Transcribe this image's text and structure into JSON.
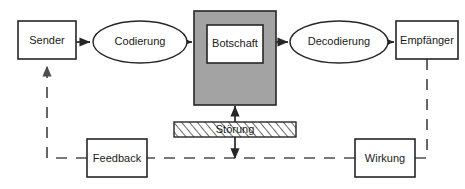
{
  "diagram": {
    "canvas": {
      "width": 465,
      "height": 189,
      "background": "#ffffff"
    },
    "colors": {
      "stroke": "#262626",
      "dashed_stroke": "#4d4d4d",
      "node_fill": "#ffffff",
      "message_outer_fill": "#a3a3a3",
      "noise_hatch_fill": "#ffffff",
      "text": "#1a1a1a"
    },
    "nodes": [
      {
        "id": "sender",
        "label": "Sender",
        "shape": "rectangle",
        "x": 18,
        "y": 21,
        "width": 58,
        "height": 38
      },
      {
        "id": "codierung",
        "label": "Codierung",
        "shape": "ellipse",
        "cx": 140,
        "cy": 42,
        "rx": 47,
        "ry": 21
      },
      {
        "id": "botschaft",
        "label": "Botschaft",
        "shape": "nested-rectangle",
        "x": 194,
        "y": 11,
        "width": 82,
        "height": 94,
        "inner_x": 207,
        "inner_y": 25,
        "inner_width": 56,
        "inner_height": 38
      },
      {
        "id": "decodierung",
        "label": "Decodierung",
        "shape": "ellipse",
        "cx": 339,
        "cy": 42,
        "rx": 49,
        "ry": 21
      },
      {
        "id": "empfaenger",
        "label": "Empfänger",
        "shape": "rectangle",
        "x": 396,
        "y": 21,
        "width": 62,
        "height": 38
      },
      {
        "id": "stoerung",
        "label": "Störung",
        "shape": "hatched-bar",
        "x": 174,
        "y": 122,
        "width": 122,
        "height": 15
      },
      {
        "id": "feedback",
        "label": "Feedback",
        "shape": "rectangle",
        "x": 87,
        "y": 139,
        "width": 60,
        "height": 38
      },
      {
        "id": "wirkung",
        "label": "Wirkung",
        "shape": "rectangle",
        "x": 355,
        "y": 139,
        "width": 60,
        "height": 38
      }
    ],
    "connections": [
      {
        "id": "sender-to-codierung",
        "from": "sender",
        "to": "codierung",
        "style": "solid",
        "arrow": "single"
      },
      {
        "id": "codierung-to-botschaft",
        "from": "codierung",
        "to": "botschaft",
        "style": "solid",
        "arrow": "single"
      },
      {
        "id": "botschaft-to-decodierung",
        "from": "botschaft",
        "to": "decodierung",
        "style": "solid",
        "arrow": "single"
      },
      {
        "id": "decodierung-to-empfaenger",
        "from": "decodierung",
        "to": "empfaenger",
        "style": "solid",
        "arrow": "single"
      },
      {
        "id": "stoerung-to-botschaft",
        "from": "stoerung",
        "to": "botschaft",
        "style": "solid",
        "arrow": "double"
      },
      {
        "id": "empfaenger-to-wirkung",
        "from": "empfaenger",
        "to": "wirkung",
        "style": "dashed",
        "arrow": "none"
      },
      {
        "id": "wirkung-to-feedback",
        "from": "wirkung",
        "to": "feedback",
        "style": "dashed",
        "arrow": "none"
      },
      {
        "id": "feedback-to-sender",
        "from": "feedback",
        "to": "sender",
        "style": "dashed",
        "arrow": "single"
      }
    ]
  }
}
